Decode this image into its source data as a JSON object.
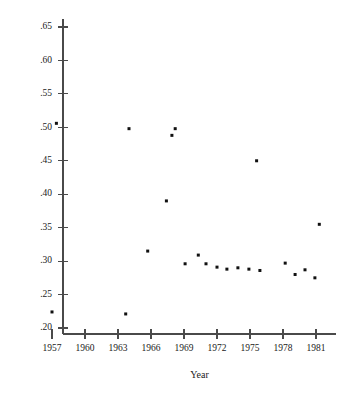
{
  "chart_data": {
    "type": "scatter",
    "title": "",
    "xlabel": "Year",
    "ylabel": "",
    "xlim": [
      1955.5,
      1982.8
    ],
    "ylim": [
      0.185,
      0.665
    ],
    "grid": false,
    "legend": null,
    "marker": {
      "shape": "square",
      "size": 3,
      "color": "#111111"
    },
    "xticks": [
      1957,
      1960,
      1963,
      1966,
      1969,
      1972,
      1975,
      1978,
      1981
    ],
    "xticklabels": [
      "1957",
      "1960",
      "1963",
      "1966",
      "1969",
      "1972",
      "1975",
      "1978",
      "1981"
    ],
    "yticks": [
      0.2,
      0.25,
      0.3,
      0.35,
      0.4,
      0.45,
      0.5,
      0.55,
      0.6,
      0.65
    ],
    "yticklabels": [
      ".20",
      ".25",
      ".30",
      ".35",
      ".40",
      ".45",
      ".50",
      ".55",
      ".60",
      ".65"
    ],
    "x": [
      1957.0,
      1957.4,
      1963.7,
      1964.0,
      1965.7,
      1967.4,
      1967.9,
      1968.2,
      1969.1,
      1970.3,
      1971.0,
      1972.0,
      1972.9,
      1973.9,
      1974.9,
      1975.6,
      1975.9,
      1978.2,
      1979.1,
      1980.0,
      1980.9,
      1981.3
    ],
    "y": [
      0.224,
      0.506,
      0.221,
      0.498,
      0.315,
      0.39,
      0.488,
      0.498,
      0.296,
      0.309,
      0.296,
      0.291,
      0.288,
      0.29,
      0.288,
      0.45,
      0.286,
      0.297,
      0.28,
      0.287,
      0.275,
      0.355
    ],
    "points": [
      {
        "x": 1957.0,
        "y": 0.224
      },
      {
        "x": 1957.4,
        "y": 0.506
      },
      {
        "x": 1963.7,
        "y": 0.221
      },
      {
        "x": 1964.0,
        "y": 0.498
      },
      {
        "x": 1965.7,
        "y": 0.315
      },
      {
        "x": 1967.4,
        "y": 0.39
      },
      {
        "x": 1967.9,
        "y": 0.488
      },
      {
        "x": 1968.2,
        "y": 0.498
      },
      {
        "x": 1969.1,
        "y": 0.296
      },
      {
        "x": 1970.3,
        "y": 0.309
      },
      {
        "x": 1971.0,
        "y": 0.296
      },
      {
        "x": 1972.0,
        "y": 0.291
      },
      {
        "x": 1972.9,
        "y": 0.288
      },
      {
        "x": 1973.9,
        "y": 0.29
      },
      {
        "x": 1974.9,
        "y": 0.288
      },
      {
        "x": 1975.6,
        "y": 0.45
      },
      {
        "x": 1975.9,
        "y": 0.286
      },
      {
        "x": 1978.2,
        "y": 0.297
      },
      {
        "x": 1979.1,
        "y": 0.28
      },
      {
        "x": 1980.0,
        "y": 0.287
      },
      {
        "x": 1980.9,
        "y": 0.275
      },
      {
        "x": 1981.3,
        "y": 0.355
      }
    ]
  }
}
